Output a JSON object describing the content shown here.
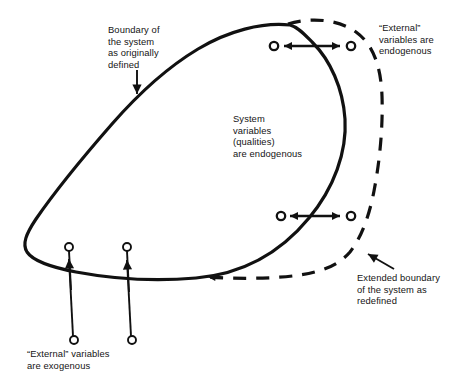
{
  "figure": {
    "background_color": "#ffffff",
    "ink_color": "#111111",
    "type": "concept-diagram",
    "labels": {
      "boundary_original": "Boundary of\nthe system\nas originally\ndefined",
      "external_endogenous": "“External”\nvariables are\nendogenous",
      "system_variables": "System\nvariables\n(qualities)\nare endogenous",
      "extended_boundary": "Extended boundary\nof the system as\nredefined",
      "external_exogenous": "“External” variables\nare exogenous"
    },
    "shapes": {
      "original_boundary": {
        "name": "original-system-boundary",
        "style": "solid",
        "stroke_width": 3.2,
        "closed": true
      },
      "extended_boundary": {
        "name": "extended-system-boundary",
        "style": "dashed",
        "stroke_width": 3.2,
        "dash_pattern": "13 10",
        "closed": false
      }
    },
    "connectors": {
      "endogenous_pairs": [
        {
          "name": "endogenous-arrow-top",
          "left_node_x": 273,
          "right_node_x": 351,
          "y": 46,
          "double_headed": true
        },
        {
          "name": "endogenous-arrow-bottom",
          "left_node_x": 280,
          "right_node_x": 351,
          "y": 216,
          "double_headed": true
        }
      ],
      "exogenous_pairs": [
        {
          "name": "exogenous-arrow-left",
          "x": 71,
          "top_node_y": 247,
          "bottom_node_y": 340,
          "direction": "up"
        },
        {
          "name": "exogenous-arrow-right",
          "x": 129,
          "top_node_y": 247,
          "bottom_node_y": 340,
          "direction": "up"
        }
      ],
      "pointers": [
        {
          "name": "pointer-boundary-original",
          "from_x": 137,
          "from_y": 70,
          "to_x": 137,
          "to_y": 97
        },
        {
          "name": "pointer-extended-boundary",
          "from_x": 393,
          "from_y": 268,
          "to_x": 363,
          "to_y": 250
        }
      ]
    }
  }
}
